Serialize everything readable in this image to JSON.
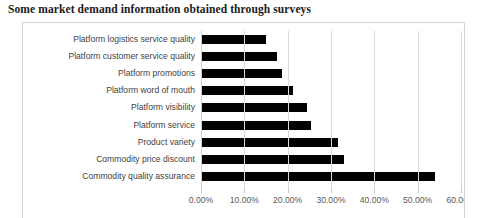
{
  "caption": "Some market demand information obtained through surveys",
  "chart_data": {
    "type": "bar",
    "orientation": "horizontal",
    "title": "",
    "xlabel": "",
    "ylabel": "",
    "xlim": [
      0,
      60
    ],
    "grid": true,
    "legend": false,
    "value_suffix": "%",
    "tick_labels": [
      "0.00%",
      "10.00%",
      "20.00%",
      "30.00%",
      "40.00%",
      "50.00%",
      "60.00%"
    ],
    "tick_values": [
      0,
      10,
      20,
      30,
      40,
      50,
      60
    ],
    "bar_color": "#000000",
    "grid_color": "#d9d9d9",
    "categories": [
      "Platform logistics service quality",
      "Platform customer service quality",
      "Platform promotions",
      "Platform word of mouth",
      "Platform visibility",
      "Platform service",
      "Product variety",
      "Commodity price discount",
      "Commodity quality assurance"
    ],
    "values": [
      15.0,
      17.5,
      18.7,
      21.2,
      24.4,
      25.4,
      31.5,
      33.0,
      54.0
    ]
  }
}
